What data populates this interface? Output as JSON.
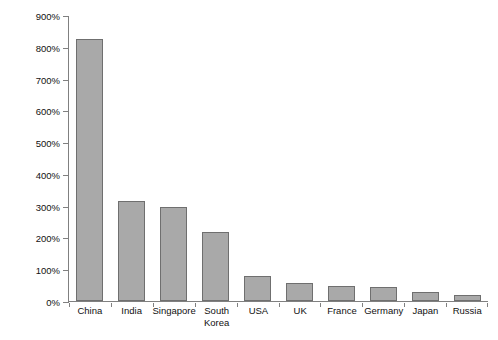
{
  "chart_data": {
    "type": "bar",
    "title": "",
    "xlabel": "",
    "ylabel": "% change in GDP from 1990 to 2013",
    "ylim": [
      0,
      900
    ],
    "yticks": [
      "0%",
      "100%",
      "200%",
      "300%",
      "400%",
      "500%",
      "600%",
      "700%",
      "800%",
      "900%"
    ],
    "ytick_values": [
      0,
      100,
      200,
      300,
      400,
      500,
      600,
      700,
      800,
      900
    ],
    "grid": false,
    "legend": "none",
    "categories": [
      "China",
      "India",
      "Singapore",
      "South\nKorea",
      "USA",
      "UK",
      "France",
      "Germany",
      "Japan",
      "Russia"
    ],
    "values": [
      825,
      315,
      297,
      218,
      78,
      58,
      46,
      43,
      28,
      20
    ],
    "bars": [
      {
        "label": "China",
        "value": 825
      },
      {
        "label": "India",
        "value": 315
      },
      {
        "label": "Singapore",
        "value": 297
      },
      {
        "label": "South\nKorea",
        "value": 218
      },
      {
        "label": "USA",
        "value": 78
      },
      {
        "label": "UK",
        "value": 58
      },
      {
        "label": "France",
        "value": 46
      },
      {
        "label": "Germany",
        "value": 43
      },
      {
        "label": "Japan",
        "value": 28
      },
      {
        "label": "Russia",
        "value": 20
      }
    ],
    "colors": {
      "bar_fill": "#a9a9a9",
      "bar_stroke": "#6f6f6f",
      "axis": "#808080",
      "text": "#111111",
      "background": "#ffffff"
    }
  }
}
